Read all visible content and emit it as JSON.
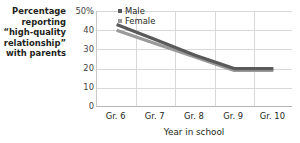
{
  "chart_data": {
    "type": "line",
    "title": "",
    "subtitle": "",
    "categories": [
      "Gr. 6",
      "Gr. 7",
      "Gr. 8",
      "Gr. 9",
      "Gr. 10"
    ],
    "series": [
      {
        "name": "Male",
        "color": "#5a5a5a",
        "values": [
          43,
          35,
          27,
          20,
          20
        ]
      },
      {
        "name": "Female",
        "color": "#9a9a9a",
        "values": [
          40,
          33,
          26,
          19,
          19
        ]
      }
    ],
    "xlabel": "Year in school",
    "ylabel_lines": [
      "Percentage",
      "reporting",
      "“high-quality",
      "relationship”",
      "with parents"
    ],
    "yticks": [
      "50%",
      "40",
      "30",
      "20",
      "10",
      "0"
    ],
    "ytick_values": [
      50,
      40,
      30,
      20,
      10,
      0
    ],
    "ylim": [
      0,
      50
    ],
    "grid": true,
    "legend_position": "top-right-inside"
  },
  "colors": {
    "male_line": "#5a5a5a",
    "female_line": "#9a9a9a",
    "gridline": "#d8d8d8",
    "axis": "#b4b4b4",
    "text": "#231f20",
    "background": "#ffffff"
  }
}
